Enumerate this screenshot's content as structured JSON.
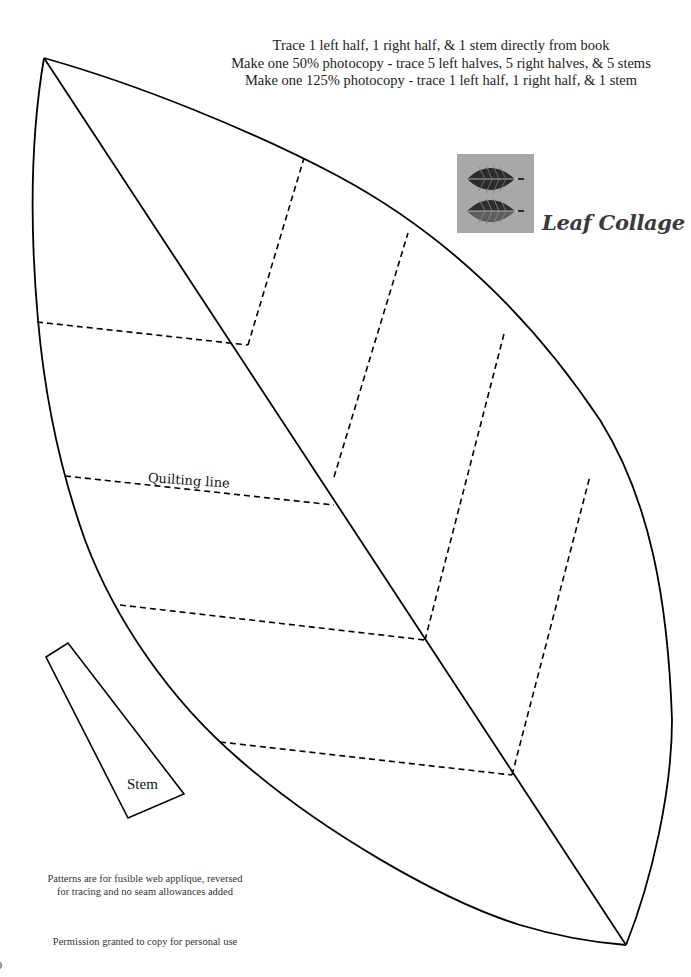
{
  "instructions": {
    "line1": "Trace 1 left half, 1 right half, & 1 stem directly from book",
    "line2": "Make one 50% photocopy - trace 5 left halves, 5 right halves, & 5 stems",
    "line3": "Make one 125% photocopy - trace 1 left half, 1 right half, & 1 stem"
  },
  "logo": {
    "title": "Leaf Collage",
    "box_color": "#a8a8a8",
    "leaf_color_dark": "#2b2b2b",
    "leaf_color_mid": "#5e5e5e"
  },
  "pattern": {
    "quilting_label": "Quilting line",
    "stem_label": "Stem",
    "line_color": "#000000"
  },
  "footer": {
    "note_line1": "Patterns are for fusible web applique, reversed",
    "note_line2": "for tracing and no seam allowances added",
    "permission": "Permission granted to copy for personal use",
    "page_number": "9"
  }
}
